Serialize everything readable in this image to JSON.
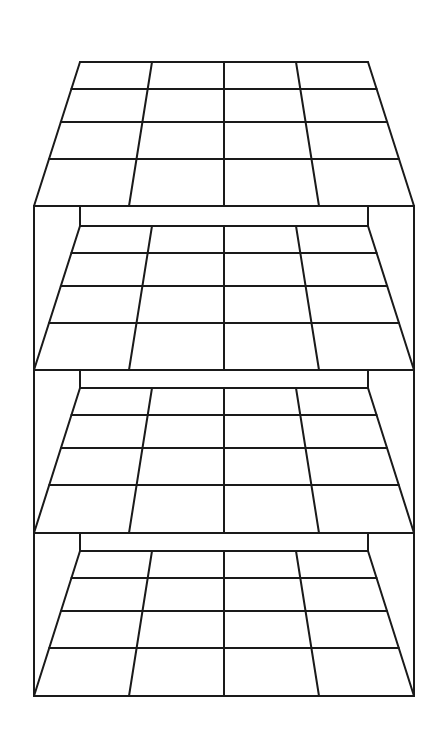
{
  "title": "Stacked grid layers",
  "colors": {
    "stroke": "#1a1a1a",
    "background": "#ffffff"
  },
  "diagram": {
    "layer_count": 4,
    "grid_columns": 4,
    "grid_rows": 4,
    "outer_box": {
      "left": 34,
      "right": 414,
      "top": 206,
      "bottom": 696
    },
    "back_posts": {
      "left": 80,
      "right": 368
    },
    "layers": [
      {
        "name": "layer-1",
        "back_y": 62,
        "front_y": 206,
        "row_y": [
          62,
          89,
          122,
          159,
          206
        ]
      },
      {
        "name": "layer-2",
        "back_y": 226,
        "front_y": 370,
        "row_y": [
          226,
          253,
          286,
          323,
          370
        ]
      },
      {
        "name": "layer-3",
        "back_y": 388,
        "front_y": 533,
        "row_y": [
          388,
          415,
          448,
          485,
          533
        ]
      },
      {
        "name": "layer-4",
        "back_y": 551,
        "front_y": 696,
        "row_y": [
          551,
          578,
          611,
          648,
          696
        ]
      }
    ]
  }
}
